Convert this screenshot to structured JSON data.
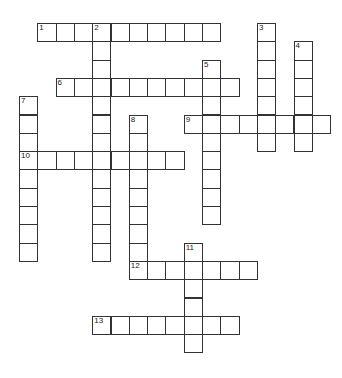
{
  "puzzle": {
    "type": "crossword",
    "grid": {
      "origin_x": 19,
      "origin_y": 23,
      "cell_size": 18.3
    },
    "entries": [
      {
        "number": "1",
        "direction": "across",
        "row": 0,
        "col": 1,
        "length": 10
      },
      {
        "number": "2",
        "direction": "down",
        "row": 0,
        "col": 4,
        "length": 13
      },
      {
        "number": "3",
        "direction": "down",
        "row": 0,
        "col": 13,
        "length": 7
      },
      {
        "number": "4",
        "direction": "down",
        "row": 1,
        "col": 15,
        "length": 6
      },
      {
        "number": "5",
        "direction": "down",
        "row": 2,
        "col": 10,
        "length": 9
      },
      {
        "number": "6",
        "direction": "across",
        "row": 3,
        "col": 2,
        "length": 10
      },
      {
        "number": "7",
        "direction": "down",
        "row": 4,
        "col": 0,
        "length": 9
      },
      {
        "number": "8",
        "direction": "down",
        "row": 5,
        "col": 6,
        "length": 8
      },
      {
        "number": "9",
        "direction": "across",
        "row": 5,
        "col": 9,
        "length": 8
      },
      {
        "number": "10",
        "direction": "across",
        "row": 7,
        "col": 0,
        "length": 9
      },
      {
        "number": "11",
        "direction": "down",
        "row": 12,
        "col": 9,
        "length": 6
      },
      {
        "number": "12",
        "direction": "across",
        "row": 13,
        "col": 6,
        "length": 7
      },
      {
        "number": "13",
        "direction": "across",
        "row": 16,
        "col": 4,
        "length": 8
      }
    ]
  }
}
